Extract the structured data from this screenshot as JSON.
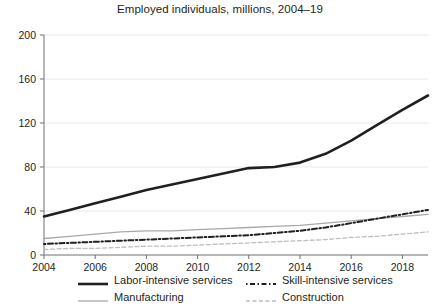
{
  "chart_data": {
    "type": "line",
    "title": "Employed individuals, millions, 2004–19",
    "xlabel": "",
    "ylabel": "",
    "xlim": [
      2004,
      2019
    ],
    "ylim": [
      0,
      200
    ],
    "yticks": [
      0,
      40,
      80,
      120,
      160,
      200
    ],
    "ytick_labels": [
      "0",
      "40",
      "80",
      "120",
      "160",
      "200"
    ],
    "xticks": [
      2004,
      2006,
      2008,
      2010,
      2012,
      2014,
      2016,
      2018
    ],
    "xtick_labels": [
      "2004",
      "2006",
      "2008",
      "2010",
      "2012",
      "2014",
      "2016",
      "2018"
    ],
    "grid": "horizontal",
    "legend_position": "bottom",
    "x": [
      2004,
      2005,
      2006,
      2007,
      2008,
      2009,
      2010,
      2011,
      2012,
      2013,
      2014,
      2015,
      2016,
      2017,
      2018,
      2019
    ],
    "series": [
      {
        "name": "Labor-intensive services",
        "style": "solid",
        "color": "#231f20",
        "width": 2.6,
        "values": [
          35,
          41,
          47,
          53,
          59,
          64,
          69,
          74,
          79,
          80,
          84,
          92,
          104,
          118,
          132,
          145
        ]
      },
      {
        "name": "Manufacturing",
        "style": "solid",
        "color": "#a7a9ac",
        "width": 1.3,
        "values": [
          15,
          17,
          19,
          21,
          22,
          22,
          23,
          24,
          25,
          26,
          27,
          29,
          31,
          33,
          35,
          37
        ]
      },
      {
        "name": "Skill-intensive services",
        "style": "dashdot",
        "color": "#231f20",
        "width": 2.0,
        "values": [
          10,
          11,
          12,
          13,
          14,
          15,
          16,
          17,
          18,
          20,
          22,
          25,
          29,
          33,
          37,
          41
        ]
      },
      {
        "name": "Construction",
        "style": "dashed",
        "color": "#bcbec0",
        "width": 1.3,
        "values": [
          5,
          6,
          6,
          7,
          8,
          8,
          9,
          10,
          11,
          12,
          13,
          14,
          16,
          17,
          19,
          21
        ]
      }
    ],
    "series_endpoints_2019": {
      "Labor-intensive services": 177,
      "Skill-intensive services": 41,
      "Manufacturing": 37,
      "Construction": 21
    }
  },
  "legend": {
    "entries": [
      {
        "label": "Labor-intensive services",
        "swatch": "thick-black-solid-line-icon"
      },
      {
        "label": "Skill-intensive services",
        "swatch": "black-dash-dot-line-icon"
      },
      {
        "label": "Manufacturing",
        "swatch": "thin-gray-solid-line-icon"
      },
      {
        "label": "Construction",
        "swatch": "light-gray-dashed-line-icon"
      }
    ]
  },
  "colors": {
    "text": "#231f20",
    "grid": "#e8e8e8",
    "axis": "#6d6e71",
    "gray_series": "#a7a9ac",
    "light_gray_series": "#bcbec0"
  }
}
